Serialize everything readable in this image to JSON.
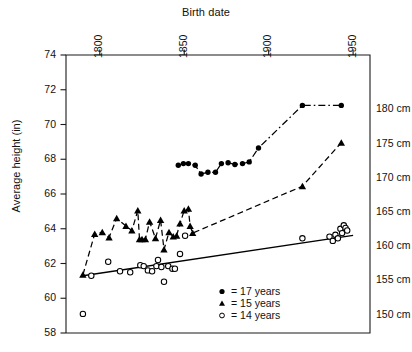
{
  "chart_data": {
    "type": "scatter",
    "title": "Birth date",
    "xlabel": "Birth date",
    "ylabel": "Average height (in)",
    "xlim": [
      1780,
      1960
    ],
    "ylim": [
      58,
      74
    ],
    "xticks": [
      1800,
      1850,
      1900,
      1950
    ],
    "xtick_labels": [
      "1800",
      "1850",
      "1900",
      "1950"
    ],
    "yticks": [
      58,
      60,
      62,
      64,
      66,
      68,
      70,
      72,
      74
    ],
    "ytick_labels": [
      "58",
      "60",
      "62",
      "64",
      "66",
      "68",
      "70",
      "72",
      "74"
    ],
    "right_axis_label": "cm",
    "right_ticks_in": [
      59.055,
      61.024,
      62.992,
      64.961,
      66.929,
      68.898,
      70.866
    ],
    "right_tick_labels": [
      "150 cm",
      "155 cm",
      "160 cm",
      "165 cm",
      "170 cm",
      "175 cm",
      "180 cm"
    ],
    "grid": false,
    "legend_position": "lower-center-right",
    "series": [
      {
        "name": "17 years",
        "legend_label": "= 17 years",
        "marker": "filled-circle",
        "line": "dash-dot",
        "color": "#000000",
        "points": [
          [
            1846.5,
            67.65
          ],
          [
            1849.5,
            67.75
          ],
          [
            1852.5,
            67.75
          ],
          [
            1856.5,
            67.65
          ],
          [
            1860.0,
            67.15
          ],
          [
            1864.0,
            67.25
          ],
          [
            1868.5,
            67.25
          ],
          [
            1872.0,
            67.75
          ],
          [
            1876.0,
            67.8
          ],
          [
            1880.0,
            67.7
          ],
          [
            1884.5,
            67.75
          ],
          [
            1888.5,
            67.85
          ],
          [
            1894.0,
            68.65
          ],
          [
            1920.0,
            71.1
          ],
          [
            1943.0,
            71.1
          ]
        ]
      },
      {
        "name": "15 years",
        "legend_label": "= 15 years",
        "marker": "filled-triangle",
        "line": "dashed",
        "color": "#000000",
        "points": [
          [
            1790.0,
            61.35
          ],
          [
            1797.0,
            63.7
          ],
          [
            1801.5,
            63.8
          ],
          [
            1805.5,
            63.5
          ],
          [
            1810.0,
            64.6
          ],
          [
            1815.5,
            64.15
          ],
          [
            1819.0,
            63.9
          ],
          [
            1822.5,
            65.05
          ],
          [
            1823.5,
            63.4
          ],
          [
            1825.0,
            63.4
          ],
          [
            1827.0,
            63.4
          ],
          [
            1829.5,
            64.4
          ],
          [
            1833.0,
            63.45
          ],
          [
            1836.0,
            64.5
          ],
          [
            1838.0,
            62.8
          ],
          [
            1841.0,
            63.8
          ],
          [
            1843.5,
            63.55
          ],
          [
            1845.5,
            63.6
          ],
          [
            1847.5,
            64.3
          ],
          [
            1850.0,
            65.05
          ],
          [
            1852.5,
            65.15
          ],
          [
            1853.5,
            64.15
          ],
          [
            1855.0,
            63.75
          ],
          [
            1920.0,
            66.45
          ],
          [
            1943.0,
            68.95
          ]
        ]
      },
      {
        "name": "14 years",
        "legend_label": "= 14 years",
        "marker": "open-circle",
        "line": "solid-trend",
        "color": "#000000",
        "points": [
          [
            1790.0,
            59.1
          ],
          [
            1795.0,
            61.3
          ],
          [
            1805.0,
            62.1
          ],
          [
            1812.0,
            61.55
          ],
          [
            1818.0,
            61.5
          ],
          [
            1824.0,
            61.9
          ],
          [
            1826.0,
            61.85
          ],
          [
            1828.5,
            61.6
          ],
          [
            1831.0,
            61.55
          ],
          [
            1833.5,
            61.85
          ],
          [
            1834.5,
            62.2
          ],
          [
            1836.5,
            61.8
          ],
          [
            1838.0,
            60.95
          ],
          [
            1840.5,
            61.85
          ],
          [
            1843.0,
            61.7
          ],
          [
            1844.5,
            61.7
          ],
          [
            1847.5,
            62.55
          ],
          [
            1850.5,
            63.6
          ],
          [
            1920.0,
            63.45
          ],
          [
            1936.0,
            63.55
          ],
          [
            1938.0,
            63.3
          ],
          [
            1939.5,
            63.65
          ],
          [
            1941.0,
            63.45
          ],
          [
            1942.5,
            64.0
          ],
          [
            1943.5,
            63.75
          ],
          [
            1944.5,
            64.2
          ],
          [
            1945.5,
            64.05
          ],
          [
            1946.5,
            63.9
          ]
        ],
        "trend_line": [
          [
            1789.0,
            61.28
          ],
          [
            1950.0,
            63.62
          ]
        ]
      }
    ]
  }
}
